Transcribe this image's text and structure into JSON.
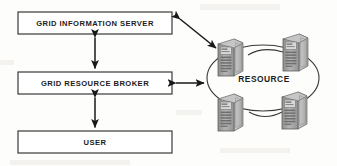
{
  "diagram": {
    "background_color": "#fdfdfc",
    "line_color": "#33322f",
    "text_color": "#1c1c1c",
    "boxes": [
      {
        "id": "grid-information-server",
        "label": "GRID INFORMATION SERVER",
        "x": 18,
        "y": 12,
        "width": 154,
        "height": 22
      },
      {
        "id": "grid-resource-broker",
        "label": "GRID RESOURCE BROKER",
        "x": 18,
        "y": 72,
        "width": 154,
        "height": 22
      },
      {
        "id": "user",
        "label": "USER",
        "x": 18,
        "y": 131,
        "width": 154,
        "height": 22
      }
    ],
    "cluster": {
      "label": "RESOURCE",
      "label_x": 264,
      "label_y": 80,
      "ellipse": {
        "cx": 263,
        "cy": 78,
        "rx": 56,
        "ry": 33
      },
      "nodes": [
        {
          "id": "resource-node-top-left",
          "x": 215,
          "y": 37,
          "width": 34,
          "height": 40
        },
        {
          "id": "resource-node-top-right",
          "x": 280,
          "y": 32,
          "width": 34,
          "height": 40
        },
        {
          "id": "resource-node-bottom-left",
          "x": 215,
          "y": 92,
          "width": 34,
          "height": 40
        },
        {
          "id": "resource-node-bottom-right",
          "x": 279,
          "y": 90,
          "width": 34,
          "height": 40
        }
      ]
    },
    "connectors": [
      {
        "id": "connector-gis-to-broker",
        "kind": "vertical-double-arrow",
        "label": ""
      },
      {
        "id": "connector-broker-to-user",
        "kind": "vertical-double-arrow",
        "label": ""
      },
      {
        "id": "connector-broker-to-resource",
        "kind": "horizontal-double-arrow",
        "label": ""
      },
      {
        "id": "connector-gis-to-resource",
        "kind": "diagonal-double-arrow",
        "label": ""
      }
    ]
  }
}
